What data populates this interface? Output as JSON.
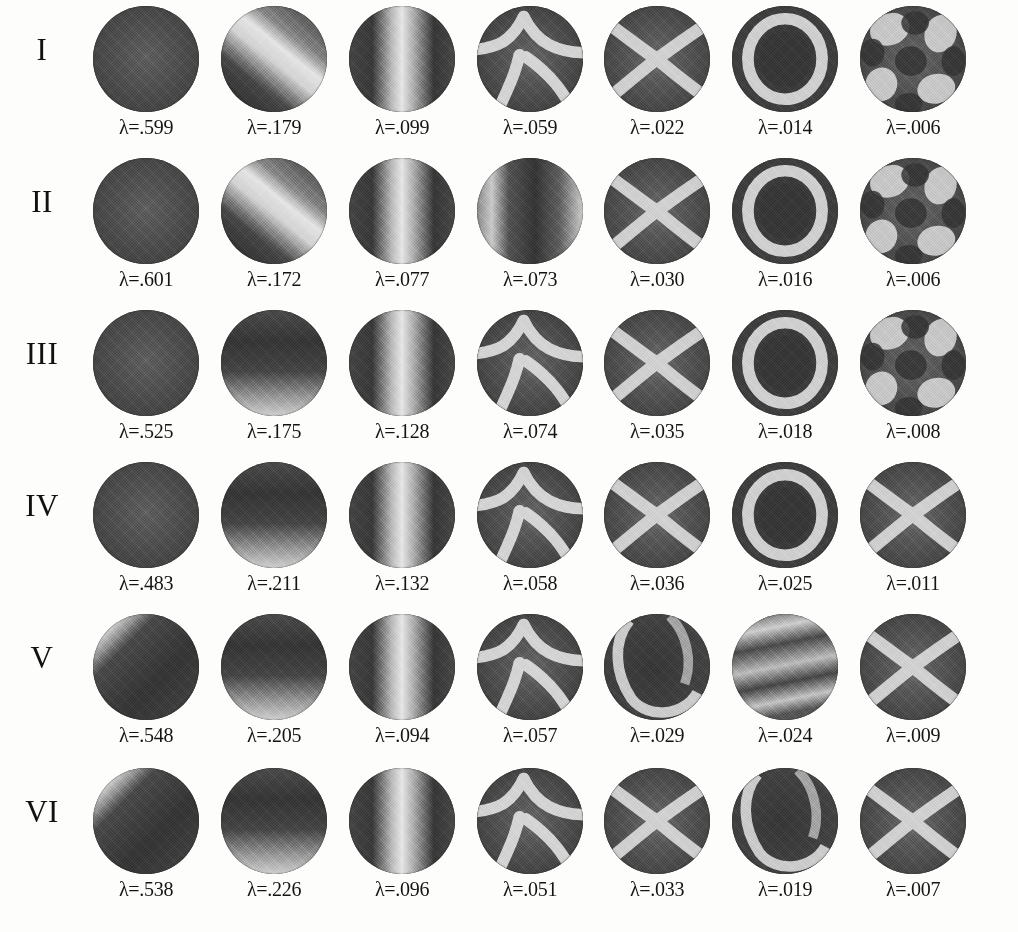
{
  "figure": {
    "kind": "eigenmode-grid",
    "row_count": 6,
    "column_count": 7,
    "label_prefix": "λ=",
    "background_color": "#fdfdfc",
    "ink_color": "#141414"
  },
  "rows": [
    {
      "label": "I",
      "cells": [
        {
          "eigenvalue": ".599",
          "label": "λ=.599"
        },
        {
          "eigenvalue": ".179",
          "label": "λ=.179"
        },
        {
          "eigenvalue": ".099",
          "label": "λ=.099"
        },
        {
          "eigenvalue": ".059",
          "label": "λ=.059"
        },
        {
          "eigenvalue": ".022",
          "label": "λ=.022"
        },
        {
          "eigenvalue": ".014",
          "label": "λ=.014"
        },
        {
          "eigenvalue": ".006",
          "label": "λ=.006"
        }
      ]
    },
    {
      "label": "II",
      "cells": [
        {
          "eigenvalue": ".601",
          "label": "λ=.601"
        },
        {
          "eigenvalue": ".172",
          "label": "λ=.172"
        },
        {
          "eigenvalue": ".077",
          "label": "λ=.077"
        },
        {
          "eigenvalue": ".073",
          "label": "λ=.073"
        },
        {
          "eigenvalue": ".030",
          "label": "λ=.030"
        },
        {
          "eigenvalue": ".016",
          "label": "λ=.016"
        },
        {
          "eigenvalue": ".006",
          "label": "λ=.006"
        }
      ]
    },
    {
      "label": "III",
      "cells": [
        {
          "eigenvalue": ".525",
          "label": "λ=.525"
        },
        {
          "eigenvalue": ".175",
          "label": "λ=.175"
        },
        {
          "eigenvalue": ".128",
          "label": "λ=.128"
        },
        {
          "eigenvalue": ".074",
          "label": "λ=.074"
        },
        {
          "eigenvalue": ".035",
          "label": "λ=.035"
        },
        {
          "eigenvalue": ".018",
          "label": "λ=.018"
        },
        {
          "eigenvalue": ".008",
          "label": "λ=.008"
        }
      ]
    },
    {
      "label": "IV",
      "cells": [
        {
          "eigenvalue": ".483",
          "label": "λ=.483"
        },
        {
          "eigenvalue": ".211",
          "label": "λ=.211"
        },
        {
          "eigenvalue": ".132",
          "label": "λ=.132"
        },
        {
          "eigenvalue": ".058",
          "label": "λ=.058"
        },
        {
          "eigenvalue": ".036",
          "label": "λ=.036"
        },
        {
          "eigenvalue": ".025",
          "label": "λ=.025"
        },
        {
          "eigenvalue": ".011",
          "label": "λ=.011"
        }
      ]
    },
    {
      "label": "V",
      "cells": [
        {
          "eigenvalue": ".548",
          "label": "λ=.548"
        },
        {
          "eigenvalue": ".205",
          "label": "λ=.205"
        },
        {
          "eigenvalue": ".094",
          "label": "λ=.094"
        },
        {
          "eigenvalue": ".057",
          "label": "λ=.057"
        },
        {
          "eigenvalue": ".029",
          "label": "λ=.029"
        },
        {
          "eigenvalue": ".024",
          "label": "λ=.024"
        },
        {
          "eigenvalue": ".009",
          "label": "λ=.009"
        }
      ]
    },
    {
      "label": "VI",
      "cells": [
        {
          "eigenvalue": ".538",
          "label": "λ=.538"
        },
        {
          "eigenvalue": ".226",
          "label": "λ=.226"
        },
        {
          "eigenvalue": ".096",
          "label": "λ=.096"
        },
        {
          "eigenvalue": ".051",
          "label": "λ=.051"
        },
        {
          "eigenvalue": ".033",
          "label": "λ=.033"
        },
        {
          "eigenvalue": ".019",
          "label": "λ=.019"
        },
        {
          "eigenvalue": ".007",
          "label": "λ=.007"
        }
      ]
    }
  ],
  "chart_data": {
    "type": "heatmap",
    "title": "",
    "xlabel": "",
    "ylabel": "",
    "row_labels": [
      "I",
      "II",
      "III",
      "IV",
      "V",
      "VI"
    ],
    "column_index": [
      1,
      2,
      3,
      4,
      5,
      6,
      7
    ],
    "value_label_prefix": "λ=",
    "series": [
      {
        "name": "I",
        "values": [
          0.599,
          0.179,
          0.099,
          0.059,
          0.022,
          0.014,
          0.006
        ]
      },
      {
        "name": "II",
        "values": [
          0.601,
          0.172,
          0.077,
          0.073,
          0.03,
          0.016,
          0.006
        ]
      },
      {
        "name": "III",
        "values": [
          0.525,
          0.175,
          0.128,
          0.074,
          0.035,
          0.018,
          0.008
        ]
      },
      {
        "name": "IV",
        "values": [
          0.483,
          0.211,
          0.132,
          0.058,
          0.036,
          0.025,
          0.011
        ]
      },
      {
        "name": "V",
        "values": [
          0.548,
          0.205,
          0.094,
          0.057,
          0.029,
          0.024,
          0.009
        ]
      },
      {
        "name": "VI",
        "values": [
          0.538,
          0.226,
          0.096,
          0.051,
          0.033,
          0.019,
          0.007
        ]
      }
    ],
    "value_range": [
      0.006,
      0.601
    ],
    "grid": false,
    "legend": "none"
  },
  "modes": [
    [
      {
        "pattern": "uniform"
      },
      {
        "pattern": "dipole-diagonal"
      },
      {
        "pattern": "dipole-vertical"
      },
      {
        "pattern": "quad-cross"
      },
      {
        "pattern": "quad-x"
      },
      {
        "pattern": "ring"
      },
      {
        "pattern": "multi-lobe"
      }
    ],
    [
      {
        "pattern": "uniform"
      },
      {
        "pattern": "dipole-diagonal"
      },
      {
        "pattern": "dipole-vertical"
      },
      {
        "pattern": "dipole-vertical-wide"
      },
      {
        "pattern": "quad-x"
      },
      {
        "pattern": "ring"
      },
      {
        "pattern": "multi-lobe"
      }
    ],
    [
      {
        "pattern": "uniform"
      },
      {
        "pattern": "dipole-horizontal"
      },
      {
        "pattern": "dipole-vertical"
      },
      {
        "pattern": "quad-cross"
      },
      {
        "pattern": "quad-x"
      },
      {
        "pattern": "ring"
      },
      {
        "pattern": "multi-lobe"
      }
    ],
    [
      {
        "pattern": "uniform"
      },
      {
        "pattern": "dipole-horizontal"
      },
      {
        "pattern": "dipole-vertical"
      },
      {
        "pattern": "quad-cross"
      },
      {
        "pattern": "quad-x"
      },
      {
        "pattern": "ring"
      },
      {
        "pattern": "quad-x"
      }
    ],
    [
      {
        "pattern": "corner-band"
      },
      {
        "pattern": "dipole-horizontal"
      },
      {
        "pattern": "dipole-vertical"
      },
      {
        "pattern": "quad-cross"
      },
      {
        "pattern": "ring-offset"
      },
      {
        "pattern": "tri-band"
      },
      {
        "pattern": "quad-x"
      }
    ],
    [
      {
        "pattern": "corner-band"
      },
      {
        "pattern": "dipole-horizontal"
      },
      {
        "pattern": "dipole-vertical"
      },
      {
        "pattern": "quad-cross"
      },
      {
        "pattern": "quad-x"
      },
      {
        "pattern": "ring-offset"
      },
      {
        "pattern": "quad-x"
      }
    ]
  ]
}
